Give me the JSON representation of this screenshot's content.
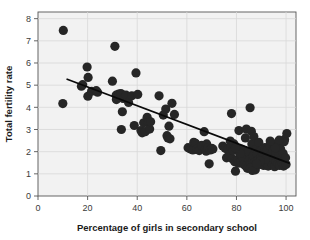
{
  "chart_data": {
    "type": "scatter",
    "title": "",
    "xlabel": "Percentage of girls in secondary school",
    "ylabel": "Total fertility rate",
    "xlim": [
      0,
      104
    ],
    "ylim": [
      0,
      8.3
    ],
    "xticks": [
      0,
      20,
      40,
      60,
      80,
      100
    ],
    "yticks": [
      0,
      1,
      2,
      3,
      4,
      5,
      6,
      7,
      8
    ],
    "xtick_labels": [
      "0",
      "20",
      "40",
      "60",
      "80",
      "100"
    ],
    "ytick_labels": [
      "0",
      "1",
      "2",
      "3",
      "4",
      "5",
      "6",
      "7",
      "8"
    ],
    "grid": true,
    "grid_color": "#d8d8d8",
    "plot_background": "#f2f2f2",
    "legend": null,
    "marker_color": "#262626",
    "marker_size": 4.6,
    "trendline": {
      "type": "linear-fit",
      "color": "#0a0a0a",
      "width": 1.7,
      "x_start": 11.5,
      "y_start": 5.28,
      "x_end": 101.5,
      "y_end": 1.47
    },
    "x": [
      10.2,
      10.0,
      17.5,
      18.0,
      19.8,
      20.2,
      20.1,
      21.6,
      23.5,
      24.0,
      30.0,
      31.0,
      31.5,
      31.6,
      32.5,
      33.2,
      33.4,
      33.6,
      34.0,
      34.3,
      35.5,
      36.5,
      37.8,
      38.8,
      39.5,
      40.2,
      41.5,
      42.0,
      42.6,
      43.2,
      44.0,
      44.5,
      45.0,
      45.4,
      48.8,
      49.5,
      50.5,
      51.5,
      52.0,
      52.4,
      52.8,
      53.2,
      54.0,
      55.0,
      60.5,
      61.5,
      62.0,
      62.4,
      62.8,
      63.5,
      64.0,
      65.0,
      66.0,
      67.0,
      67.4,
      67.8,
      68.0,
      68.5,
      69.0,
      69.5,
      70.0,
      70.5,
      74.5,
      75.5,
      76.0,
      76.5,
      77.0,
      77.5,
      77.8,
      78.0,
      78.3,
      78.6,
      79.0,
      79.3,
      79.6,
      80.0,
      80.4,
      80.8,
      81.0,
      81.4,
      81.8,
      82.2,
      82.6,
      83.0,
      83.4,
      83.8,
      84.0,
      84.4,
      84.8,
      85.2,
      85.5,
      85.8,
      86.0,
      86.2,
      86.5,
      86.8,
      87.0,
      87.4,
      87.8,
      88.0,
      88.4,
      88.8,
      89.0,
      89.4,
      89.8,
      90.0,
      90.4,
      90.8,
      91.0,
      91.4,
      91.8,
      92.0,
      92.4,
      92.8,
      93.0,
      93.4,
      93.8,
      94.0,
      94.4,
      94.8,
      95.0,
      95.4,
      95.8,
      96.0,
      96.4,
      96.8,
      97.0,
      97.4,
      97.8,
      98.0,
      98.4,
      98.8,
      99.0,
      99.4,
      99.8,
      100.0,
      100.3,
      99.2,
      97.2,
      95.6,
      93.6,
      91.6,
      89.6,
      87.6,
      85.6,
      83.6,
      81.6,
      79.6,
      86.4,
      88.2
    ],
    "y": [
      7.47,
      4.17,
      4.95,
      5.02,
      5.82,
      5.35,
      4.5,
      4.72,
      4.75,
      4.68,
      5.18,
      6.75,
      4.55,
      4.35,
      4.6,
      4.45,
      4.62,
      3.0,
      3.8,
      4.4,
      4.55,
      4.22,
      4.52,
      3.18,
      5.55,
      4.58,
      2.95,
      2.85,
      3.3,
      2.9,
      3.55,
      3.3,
      3.02,
      3.35,
      4.52,
      2.05,
      3.65,
      3.92,
      2.72,
      2.62,
      3.15,
      2.58,
      4.18,
      3.68,
      2.18,
      2.12,
      2.15,
      2.08,
      2.42,
      2.38,
      2.1,
      2.05,
      2.28,
      2.9,
      2.12,
      2.02,
      2.35,
      2.18,
      1.45,
      2.08,
      2.15,
      2.12,
      2.25,
      2.15,
      1.72,
      2.1,
      1.85,
      2.48,
      2.22,
      3.72,
      1.68,
      2.05,
      2.35,
      1.55,
      1.12,
      2.18,
      1.62,
      1.48,
      2.95,
      1.88,
      1.52,
      2.1,
      1.72,
      1.42,
      2.05,
      1.35,
      3.02,
      1.25,
      1.98,
      1.62,
      3.98,
      1.45,
      2.92,
      2.35,
      1.58,
      1.82,
      2.68,
      1.52,
      1.38,
      2.12,
      1.88,
      1.62,
      2.42,
      1.42,
      1.75,
      2.05,
      1.55,
      1.92,
      1.38,
      2.18,
      1.62,
      1.48,
      2.08,
      1.35,
      1.72,
      2.28,
      1.52,
      1.88,
      1.42,
      2.05,
      1.68,
      1.32,
      1.95,
      1.55,
      2.38,
      1.45,
      1.78,
      1.38,
      2.12,
      1.62,
      1.48,
      1.92,
      1.35,
      2.55,
      1.72,
      1.42,
      2.82,
      2.45,
      2.52,
      2.18,
      2.48,
      1.65,
      1.58,
      1.18,
      1.25,
      2.62,
      1.92,
      2.18,
      1.15,
      1.45
    ]
  },
  "axes": {
    "xlabel": "Percentage of girls in secondary school",
    "ylabel": "Total fertility rate"
  }
}
